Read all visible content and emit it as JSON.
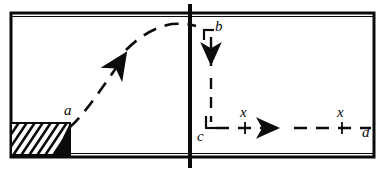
{
  "figure": {
    "type": "mechanics-diagram",
    "background_color": "#ffffff",
    "ink_color": "#0b0b0b"
  },
  "frame": {
    "name": "outer-rectangle",
    "left": 11,
    "top": 13,
    "right": 374,
    "bottom": 157,
    "stroke_width": 3
  },
  "divider": {
    "name": "vertical-divider",
    "x": 190,
    "top": 4,
    "bottom": 168,
    "stroke_width": 4
  },
  "wedge": {
    "name": "hatched-block",
    "left": 11,
    "top": 123,
    "right": 70,
    "bottom": 155,
    "hatch_angle_deg": 55,
    "hatch_count": 9,
    "triangle_fill": "#0b0b0b"
  },
  "trajectory": {
    "name": "projectile-path",
    "style": "dashed",
    "start": [
      70,
      126
    ],
    "apex": [
      175,
      24
    ],
    "end": [
      196,
      26
    ],
    "arrow_at": [
      122,
      53
    ],
    "arrow_direction": "up-right"
  },
  "drop_path": {
    "name": "vertical-drop-b-to-c",
    "style": "dashed",
    "from": [
      211,
      30
    ],
    "to": [
      211,
      128
    ],
    "arrow_at": [
      211,
      72
    ],
    "arrow_direction": "down"
  },
  "run_path": {
    "name": "horizontal-run-c-to-d",
    "style": "dashed",
    "from": [
      205,
      128
    ],
    "to": [
      371,
      128
    ],
    "arrow_at": [
      285,
      128
    ],
    "arrow_direction": "right"
  },
  "brackets": {
    "b_corner": {
      "name": "corner-bracket-b",
      "h_from": [
        204,
        30
      ],
      "h_to": [
        214,
        30
      ],
      "v_from": [
        204,
        30
      ],
      "v_to": [
        204,
        39
      ]
    },
    "c_corner": {
      "name": "corner-bracket-c",
      "v_from": [
        205,
        116
      ],
      "v_to": [
        205,
        128
      ],
      "h_from": [
        205,
        128
      ],
      "h_to": [
        215,
        128
      ]
    }
  },
  "ticks": [
    {
      "name": "tick-x-left",
      "x": 245,
      "y_top": 123,
      "y_bottom": 133
    },
    {
      "name": "tick-x-right",
      "x": 342,
      "y_top": 123,
      "y_bottom": 133
    }
  ],
  "labels": {
    "a": {
      "text": "a",
      "x": 66,
      "y": 105
    },
    "b": {
      "text": "b",
      "x": 216,
      "y": 20
    },
    "c": {
      "text": "c",
      "x": 199,
      "y": 131
    },
    "d": {
      "text": "d",
      "x": 363,
      "y": 126
    },
    "x_left": {
      "text": "x",
      "x": 240,
      "y": 108
    },
    "x_right": {
      "text": "x",
      "x": 337,
      "y": 108
    }
  }
}
